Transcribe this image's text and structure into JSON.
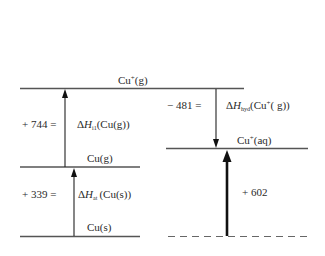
{
  "diagram": {
    "type": "enthalpy-level-diagram",
    "levels": {
      "cu_plus_g": "Cu⁺(g)",
      "cu_g": "Cu(g)",
      "cu_s": "Cu(s)",
      "cu_plus_aq": "Cu⁺(aq)",
      "reference": "dashed baseline"
    },
    "steps": [
      {
        "value": "+ 744 =",
        "symbol": "ΔH",
        "subscript": "i1",
        "species": "(Cu(g))",
        "direction": "up"
      },
      {
        "value": "+ 339 =",
        "symbol": "ΔH",
        "subscript": "at",
        "species": "(Cu(s))",
        "direction": "up"
      },
      {
        "value": "− 481 =",
        "symbol": "ΔH",
        "subscript": "hyd",
        "species": "(Cu⁺(g))",
        "direction": "down"
      },
      {
        "value": "+ 602",
        "direction": "up",
        "weight": "bold"
      }
    ]
  },
  "text": {
    "cu_plus_g_base": "Cu",
    "cu_plus_g_sup": "+",
    "cu_plus_g_state": "(g)",
    "cu_g": "Cu(g)",
    "cu_s": "Cu(s)",
    "cu_plus_aq_base": "Cu",
    "cu_plus_aq_sup": "+",
    "cu_plus_aq_state": "(aq)",
    "val_744": "+ 744 =",
    "val_339": "+ 339 =",
    "val_481": "− 481 =",
    "val_602": "+ 602",
    "delta": "Δ",
    "h": "H",
    "sub_i1": "i1",
    "sub_at": "at",
    "sub_hyd": "hyd",
    "species_744": "(Cu(g))",
    "species_339": "(Cu(s))",
    "species_481_a": "(Cu",
    "species_481_sup": "+",
    "species_481_b": "( g))"
  }
}
